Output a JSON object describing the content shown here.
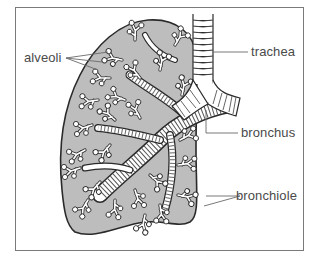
{
  "diagram": {
    "colors": {
      "lung_fill": "#bdbdbd",
      "outline": "#2a2a2a",
      "airway_fill": "#ffffff",
      "leader_line": "#6a6a6a",
      "label_text": "#4a4a4a",
      "frame": "#7a7a7a"
    },
    "labels": {
      "alveoli": "alveoli",
      "trachea": "trachea",
      "bronchus": "bronchus",
      "bronchiole": "bronchiole"
    }
  }
}
